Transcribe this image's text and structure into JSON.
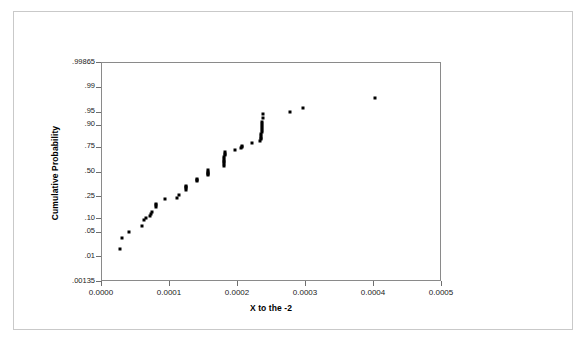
{
  "chart_data": {
    "type": "scatter",
    "title": "",
    "subtitle": "",
    "xlabel": "X to the -2",
    "ylabel": "Cumulative Probability",
    "xlim": [
      0.0,
      0.0005
    ],
    "ylim": [
      0.00135,
      0.99865
    ],
    "y_scale": "normal-probability (probit)",
    "grid": false,
    "legend": null,
    "x_ticks": [
      "0.0000",
      "0.0001",
      "0.0002",
      "0.0003",
      "0.0004",
      "0.0005"
    ],
    "x_tick_values": [
      0.0,
      0.0001,
      0.0002,
      0.0003,
      0.0004,
      0.0005
    ],
    "y_ticks": [
      ".99865",
      ".99",
      ".95",
      ".90",
      ".75",
      ".50",
      ".25",
      ".10",
      ".05",
      ".01",
      ".00135"
    ],
    "y_tick_values": [
      0.99865,
      0.99,
      0.95,
      0.9,
      0.75,
      0.5,
      0.25,
      0.1,
      0.05,
      0.01,
      0.00135
    ],
    "marker": {
      "shape": "square",
      "size_px": 3,
      "color": "#000000"
    },
    "points": [
      {
        "x": 2.7e-05,
        "y": 0.018
      },
      {
        "x": 3e-05,
        "y": 0.036
      },
      {
        "x": 4e-05,
        "y": 0.052
      },
      {
        "x": 5.9e-05,
        "y": 0.073
      },
      {
        "x": 6.2e-05,
        "y": 0.098
      },
      {
        "x": 6.5e-05,
        "y": 0.105
      },
      {
        "x": 7e-05,
        "y": 0.118
      },
      {
        "x": 7.2e-05,
        "y": 0.128
      },
      {
        "x": 7.4e-05,
        "y": 0.138
      },
      {
        "x": 7.9e-05,
        "y": 0.175
      },
      {
        "x": 7.9e-05,
        "y": 0.186
      },
      {
        "x": 7.95e-05,
        "y": 0.197
      },
      {
        "x": 9.2e-05,
        "y": 0.235
      },
      {
        "x": 0.00011,
        "y": 0.245
      },
      {
        "x": 0.000113,
        "y": 0.27
      },
      {
        "x": 0.000123,
        "y": 0.32
      },
      {
        "x": 0.000123,
        "y": 0.333
      },
      {
        "x": 0.0001235,
        "y": 0.346
      },
      {
        "x": 0.000124,
        "y": 0.358
      },
      {
        "x": 0.000139,
        "y": 0.405
      },
      {
        "x": 0.000139,
        "y": 0.418
      },
      {
        "x": 0.0001395,
        "y": 0.43
      },
      {
        "x": 0.0001555,
        "y": 0.47
      },
      {
        "x": 0.0001555,
        "y": 0.483
      },
      {
        "x": 0.000156,
        "y": 0.496
      },
      {
        "x": 0.000156,
        "y": 0.51
      },
      {
        "x": 0.0001565,
        "y": 0.523
      },
      {
        "x": 0.000179,
        "y": 0.575
      },
      {
        "x": 0.000179,
        "y": 0.592
      },
      {
        "x": 0.0001795,
        "y": 0.61
      },
      {
        "x": 0.0001795,
        "y": 0.628
      },
      {
        "x": 0.00018,
        "y": 0.645
      },
      {
        "x": 0.00018,
        "y": 0.663
      },
      {
        "x": 0.0001805,
        "y": 0.68
      },
      {
        "x": 0.0001805,
        "y": 0.698
      },
      {
        "x": 0.000181,
        "y": 0.712
      },
      {
        "x": 0.000195,
        "y": 0.73
      },
      {
        "x": 0.000205,
        "y": 0.745
      },
      {
        "x": 0.0002055,
        "y": 0.757
      },
      {
        "x": 0.000206,
        "y": 0.768
      },
      {
        "x": 0.00022,
        "y": 0.79
      },
      {
        "x": 0.000233,
        "y": 0.805
      },
      {
        "x": 0.000234,
        "y": 0.818
      },
      {
        "x": 0.000234,
        "y": 0.83
      },
      {
        "x": 0.0002345,
        "y": 0.842
      },
      {
        "x": 0.0002345,
        "y": 0.854
      },
      {
        "x": 0.000235,
        "y": 0.866
      },
      {
        "x": 0.000235,
        "y": 0.878
      },
      {
        "x": 0.0002355,
        "y": 0.888
      },
      {
        "x": 0.0002355,
        "y": 0.898
      },
      {
        "x": 0.000236,
        "y": 0.908
      },
      {
        "x": 0.000236,
        "y": 0.918
      },
      {
        "x": 0.0002365,
        "y": 0.932
      },
      {
        "x": 0.000237,
        "y": 0.946
      },
      {
        "x": 0.000276,
        "y": 0.95
      },
      {
        "x": 0.000295,
        "y": 0.962
      },
      {
        "x": 0.000402,
        "y": 0.98
      }
    ]
  },
  "axes": {
    "x_title": "X to the -2",
    "y_title": "Cumulative Probability"
  }
}
